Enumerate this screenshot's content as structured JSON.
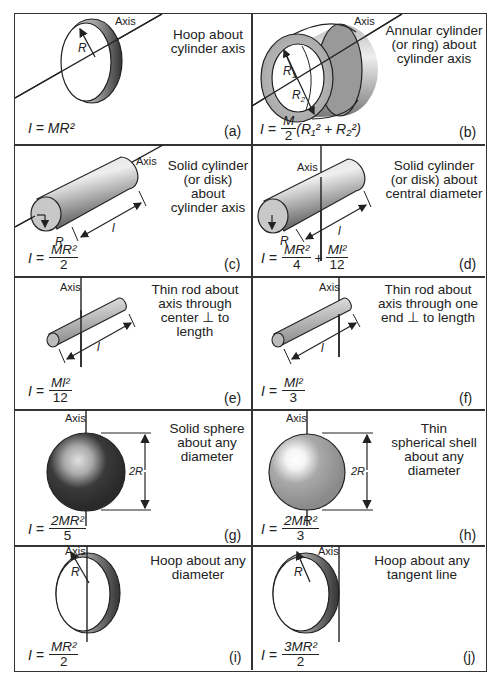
{
  "figure": {
    "axis_label": "Axis",
    "panels": [
      {
        "id": "a",
        "tag": "(a)",
        "description": "Hoop about\ncylinder axis",
        "formula": {
          "lhs": "I =",
          "expr": "MR²"
        },
        "labels": [
          "R"
        ]
      },
      {
        "id": "b",
        "tag": "(b)",
        "description": "Annular cylinder\n(or ring) about\ncylinder axis",
        "formula": {
          "lhs": "I =",
          "num": "M",
          "den": "2",
          "rest": "(R₁² + R₂²)"
        },
        "labels": [
          "R₁",
          "R₂"
        ]
      },
      {
        "id": "c",
        "tag": "(c)",
        "description": "Solid cylinder\n(or disk) about\ncylinder axis",
        "formula": {
          "lhs": "I =",
          "num": "MR²",
          "den": "2"
        },
        "labels": [
          "R",
          "l"
        ]
      },
      {
        "id": "d",
        "tag": "(d)",
        "description": "Solid cylinder\n(or disk) about\ncentral diameter",
        "formula": {
          "lhs": "I =",
          "num": "MR²",
          "den": "4",
          "plus": "+",
          "num2": "Ml²",
          "den2": "12"
        },
        "labels": [
          "R",
          "l"
        ]
      },
      {
        "id": "e",
        "tag": "(e)",
        "description": "Thin rod about\naxis through\ncenter ⊥ to\nlength",
        "formula": {
          "lhs": "I =",
          "num": "Ml²",
          "den": "12"
        },
        "labels": [
          "l"
        ]
      },
      {
        "id": "f",
        "tag": "(f)",
        "description": "Thin rod about\naxis through one\nend ⊥ to length",
        "formula": {
          "lhs": "I =",
          "num": "Ml²",
          "den": "3"
        },
        "labels": [
          "l"
        ]
      },
      {
        "id": "g",
        "tag": "(g)",
        "description": "Solid sphere\nabout any\ndiameter",
        "formula": {
          "lhs": "I =",
          "num": "2MR²",
          "den": "5"
        },
        "labels": [
          "2R"
        ]
      },
      {
        "id": "h",
        "tag": "(h)",
        "description": "Thin\nspherical shell\nabout any\ndiameter",
        "formula": {
          "lhs": "I =",
          "num": "2MR²",
          "den": "3"
        },
        "labels": [
          "2R"
        ]
      },
      {
        "id": "i",
        "tag": "(i)",
        "description": "Hoop about any\ndiameter",
        "formula": {
          "lhs": "I =",
          "num": "MR²",
          "den": "2"
        },
        "labels": [
          "R"
        ]
      },
      {
        "id": "j",
        "tag": "(j)",
        "description": "Hoop about any\ntangent line",
        "formula": {
          "lhs": "I =",
          "num": "3MR²",
          "den": "2"
        },
        "labels": [
          "R"
        ]
      }
    ]
  },
  "colors": {
    "line": "#222222",
    "shade_dark": "#3a3a3a",
    "shade_mid": "#9a9a9a",
    "shade_light": "#e8e8e8"
  }
}
